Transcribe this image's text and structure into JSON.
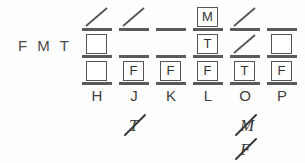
{
  "worksheet": {
    "row_label": "F M T",
    "background_color": "#fefefe",
    "ink_color": "#555555",
    "columns": [
      {
        "id": "col-h",
        "label": "H",
        "x": 82,
        "cells": [
          {
            "row": 1,
            "type": "slash",
            "value": ""
          },
          {
            "row": 2,
            "type": "box",
            "value": ""
          },
          {
            "row": 3,
            "type": "box",
            "value": ""
          }
        ],
        "annotations": []
      },
      {
        "id": "col-j",
        "label": "J",
        "x": 119,
        "cells": [
          {
            "row": 1,
            "type": "slash",
            "value": ""
          },
          {
            "row": 2,
            "type": "plain",
            "value": ""
          },
          {
            "row": 3,
            "type": "box",
            "value": "F"
          }
        ],
        "annotations": [
          {
            "text": "T",
            "struck": true
          }
        ]
      },
      {
        "id": "col-k",
        "label": "K",
        "x": 156,
        "cells": [
          {
            "row": 1,
            "type": "plain",
            "value": ""
          },
          {
            "row": 2,
            "type": "plain",
            "value": ""
          },
          {
            "row": 3,
            "type": "box",
            "value": "F"
          }
        ],
        "annotations": []
      },
      {
        "id": "col-l",
        "label": "L",
        "x": 193,
        "cells": [
          {
            "row": 1,
            "type": "box",
            "value": "M"
          },
          {
            "row": 2,
            "type": "box",
            "value": "T"
          },
          {
            "row": 3,
            "type": "box",
            "value": "F"
          }
        ],
        "annotations": []
      },
      {
        "id": "col-o",
        "label": "O",
        "x": 230,
        "cells": [
          {
            "row": 1,
            "type": "slash",
            "value": ""
          },
          {
            "row": 2,
            "type": "slash",
            "value": ""
          },
          {
            "row": 3,
            "type": "box",
            "value": "T"
          }
        ],
        "annotations": [
          {
            "text": "M",
            "struck": true
          },
          {
            "text": "F",
            "struck": true
          }
        ]
      },
      {
        "id": "col-p",
        "label": "P",
        "x": 267,
        "cells": [
          {
            "row": 1,
            "type": "plain",
            "value": ""
          },
          {
            "row": 2,
            "type": "box",
            "value": ""
          },
          {
            "row": 3,
            "type": "box",
            "value": "F"
          }
        ],
        "annotations": []
      }
    ],
    "row_tops": [
      5,
      32,
      59
    ],
    "label_top": 87,
    "annotation_top": 112,
    "annotation_line_height": 24
  }
}
